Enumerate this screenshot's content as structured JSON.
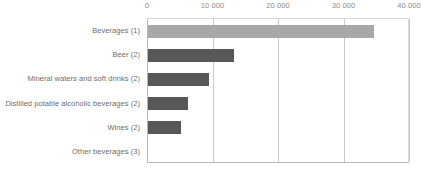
{
  "chart_data": {
    "type": "bar",
    "orientation": "horizontal",
    "title": "",
    "subtitle": "",
    "xlabel": "",
    "ylabel": "",
    "xlim": [
      0,
      40000
    ],
    "ylim": null,
    "grid": true,
    "legend": false,
    "legend_position": "none",
    "axis_position": "top",
    "categories": [
      "Beverages (1)",
      "Beer (2)",
      "Mineral waters and soft drinks (2)",
      "Distilled potable alcoholic beverages (2)",
      "Wines (2)",
      "Other beverages (3)"
    ],
    "values": [
      34500,
      13200,
      9300,
      6150,
      5000,
      0
    ],
    "bar_colors": [
      "#a8a8a8",
      "#585858",
      "#585858",
      "#585858",
      "#585858",
      "#585858"
    ],
    "xticks": [
      0,
      10000,
      20000,
      30000,
      40000
    ],
    "xtick_labels": [
      "0",
      "10 000",
      "20 000",
      "30 000",
      "40 000"
    ]
  },
  "colors": {
    "bar_light": "#a8a8a8",
    "bar_dark": "#585858",
    "gridline": "#c9c9c9",
    "axis_line": "#b9b9b9",
    "tick_text": "#8b8b8b",
    "category_text": "#6e6e6e",
    "background": "#ffffff"
  }
}
